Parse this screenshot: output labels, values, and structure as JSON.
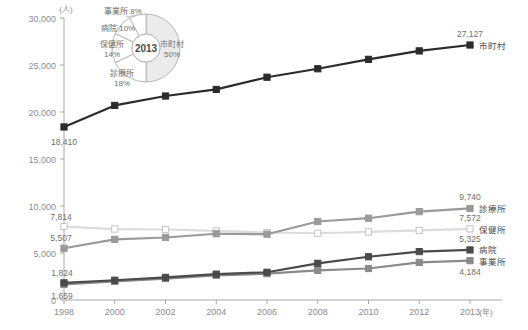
{
  "chart_data": {
    "type": "line",
    "title": "",
    "xlabel": "(年)",
    "ylabel": "(人)",
    "x": [
      1998,
      2000,
      2002,
      2004,
      2006,
      2008,
      2010,
      2012,
      2013
    ],
    "tick_labels": [
      "1998",
      "2000",
      "2002",
      "2004",
      "2006",
      "2008",
      "2010",
      "2012",
      "2013"
    ],
    "ylim": [
      0,
      30000
    ],
    "yticks": [
      0,
      5000,
      10000,
      15000,
      20000,
      25000,
      30000
    ],
    "ytick_labels": [
      "0",
      "5,000",
      "10,000",
      "15,000",
      "20,000",
      "25,000",
      "30,000"
    ],
    "grid": false,
    "legend_position": "right-inline",
    "series": [
      {
        "name": "市町村",
        "color": "#2b2b2b",
        "marker": "square-filled",
        "values": [
          18410,
          20700,
          21700,
          22400,
          23700,
          24600,
          25600,
          26500,
          27127
        ],
        "start_label": "18,410",
        "end_label": "27,127"
      },
      {
        "name": "診療所",
        "color": "#9a9a9a",
        "marker": "square-filled",
        "values": [
          5507,
          6450,
          6650,
          7050,
          7000,
          8350,
          8700,
          9400,
          9740
        ],
        "start_label": "5,507",
        "end_label": "9,740"
      },
      {
        "name": "保健所",
        "color": "#dcdcdc",
        "marker": "square-hollow",
        "values": [
          7814,
          7550,
          7500,
          7350,
          7180,
          7100,
          7250,
          7400,
          7572
        ],
        "start_label": "7,814",
        "end_label": "7,572"
      },
      {
        "name": "病院",
        "color": "#4a4a4a",
        "marker": "square-filled",
        "values": [
          1824,
          2100,
          2400,
          2750,
          2950,
          3900,
          4600,
          5150,
          5325
        ],
        "start_label": "1,824",
        "end_label": "5,325"
      },
      {
        "name": "事業所",
        "color": "#8a8a8a",
        "marker": "square-filled",
        "values": [
          1659,
          1980,
          2280,
          2620,
          2800,
          3150,
          3350,
          4000,
          4184
        ],
        "start_label": "1,659",
        "end_label": "4,184"
      }
    ]
  },
  "donut": {
    "center_label": "2013",
    "slices": [
      {
        "label": "市町村",
        "pct": "50%",
        "value": 50,
        "shaded": true
      },
      {
        "label": "診療所",
        "pct": "18%",
        "value": 18,
        "shaded": false
      },
      {
        "label": "保健所",
        "pct": "14%",
        "value": 14,
        "shaded": false
      },
      {
        "label": "病院",
        "pct": "10%",
        "value": 10,
        "shaded": false
      },
      {
        "label": "事業所",
        "pct": "8%",
        "value": 8,
        "shaded": false
      }
    ]
  },
  "axis": {
    "y_unit": "(人)",
    "x_unit": "(年)"
  }
}
